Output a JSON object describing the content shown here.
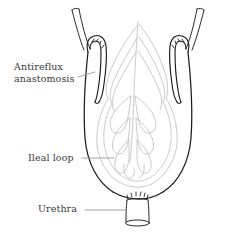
{
  "figure": {
    "type": "medical-line-illustration",
    "background_color": "#ffffff",
    "outline_color": "#1a1a1a",
    "mucosa_color": "#b9b9b9",
    "label_color": "#3a3a3a",
    "leader_color": "#9a9a9a",
    "canvas": {
      "width": 226,
      "height": 234
    }
  },
  "labels": {
    "antireflux": {
      "line1": "Antireflux",
      "line2": "anastomosis"
    },
    "ileal_loop": "Ileal loop",
    "urethra": "Urethra"
  },
  "structures": [
    {
      "name": "left-ureter",
      "description": "tubular ureter descending from upper left into pouch"
    },
    {
      "name": "right-ureter",
      "description": "tubular ureter descending from upper right into pouch"
    },
    {
      "name": "ileal-pouch",
      "description": "U-shaped ileal loop reservoir"
    },
    {
      "name": "mucosal-folds",
      "description": "light gray interior mucosal fold pattern"
    },
    {
      "name": "left-antireflux-sutures",
      "description": "suture stitch marks at left anastomosis"
    },
    {
      "name": "right-antireflux-sutures",
      "description": "suture stitch marks at right anastomosis"
    },
    {
      "name": "urethral-stump",
      "description": "short urethral tube with flared base below pouch"
    },
    {
      "name": "urethral-anastomosis-sutures",
      "description": "suture stitch marks at urethral junction"
    }
  ]
}
